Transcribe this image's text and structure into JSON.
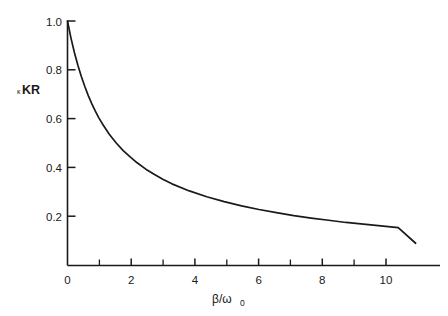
{
  "figure": {
    "background_color": "#ffffff",
    "line_color": "#1a1a1a",
    "axis_color": "#1a1a1a"
  },
  "axes": {
    "y_label_prefix": "κ",
    "y_label_main": "KR",
    "x_label_main": "β/ω",
    "x_label_sub": "0"
  },
  "chart_data": {
    "type": "line",
    "title": "",
    "subtitle": "",
    "xlabel": "β/ω₀",
    "ylabel": "κKR",
    "xlim": [
      0,
      10.7
    ],
    "ylim": [
      0,
      1.0
    ],
    "grid": false,
    "legend": null,
    "x_ticks_major": [
      0,
      2,
      4,
      6,
      8,
      10
    ],
    "x_tick_labels": [
      "0",
      "2",
      "4",
      "6",
      "8",
      "10"
    ],
    "x_ticks_minor": [
      1,
      3,
      5,
      7,
      9
    ],
    "y_ticks_major": [
      0.2,
      0.4,
      0.6,
      0.8,
      1.0
    ],
    "y_tick_labels": [
      "0.2",
      "0.4",
      "0.6",
      "0.8",
      "1.0"
    ],
    "series": [
      {
        "name": "κKR",
        "x": [
          0,
          0.1,
          0.2,
          0.3,
          0.4,
          0.5,
          0.6,
          0.7,
          0.8,
          0.9,
          1.0,
          1.2,
          1.4,
          1.6,
          1.8,
          2.0,
          2.25,
          2.5,
          2.75,
          3.0,
          3.5,
          4.0,
          4.5,
          5.0,
          5.5,
          6.0,
          6.5,
          7.0,
          7.5,
          8.0,
          8.5,
          9.0,
          9.5,
          10.0
        ],
        "y": [
          1.0,
          0.93,
          0.87,
          0.818,
          0.772,
          0.731,
          0.694,
          0.661,
          0.631,
          0.604,
          0.58,
          0.537,
          0.501,
          0.47,
          0.444,
          0.42,
          0.394,
          0.372,
          0.352,
          0.334,
          0.305,
          0.281,
          0.261,
          0.244,
          0.229,
          0.216,
          0.204,
          0.194,
          0.185,
          0.176,
          0.169,
          0.162,
          0.155,
          0.091
        ]
      }
    ]
  }
}
